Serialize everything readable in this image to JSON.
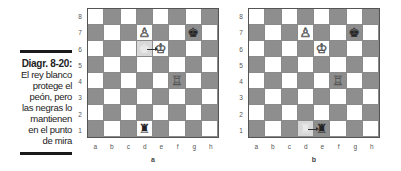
{
  "caption": {
    "title": "Diagr. 8-20:",
    "lines": [
      "El rey blanco",
      "protege el",
      "peón, pero",
      "las negras lo",
      "mantienen",
      "en el punto",
      "de mira"
    ]
  },
  "ranks": [
    "8",
    "7",
    "6",
    "5",
    "4",
    "3",
    "2",
    "1"
  ],
  "files": [
    "a",
    "b",
    "c",
    "d",
    "e",
    "f",
    "g",
    "h"
  ],
  "icons": {
    "white_king": "♔",
    "white_rook": "♖",
    "white_pawn": "♙",
    "black_king": "♚",
    "black_rook": "♜"
  },
  "boards": [
    {
      "id": "a",
      "pieces": [
        {
          "square": "d7",
          "piece": "white-pawn",
          "glyph": "♙",
          "color": "white"
        },
        {
          "square": "g7",
          "piece": "black-king",
          "glyph": "♚",
          "color": "black"
        },
        {
          "square": "d6",
          "piece": "white-king-ghost",
          "glyph": "♚",
          "color": "ghost"
        },
        {
          "square": "e6",
          "piece": "white-king",
          "glyph": "♔",
          "color": "white"
        },
        {
          "square": "f4",
          "piece": "white-rook",
          "glyph": "♖",
          "color": "white"
        },
        {
          "square": "d1",
          "piece": "black-rook",
          "glyph": "♜",
          "color": "black"
        }
      ],
      "moves": [
        {
          "from": "d6",
          "to": "e6"
        }
      ]
    },
    {
      "id": "b",
      "pieces": [
        {
          "square": "d7",
          "piece": "white-pawn",
          "glyph": "♙",
          "color": "white"
        },
        {
          "square": "g7",
          "piece": "black-king",
          "glyph": "♚",
          "color": "black"
        },
        {
          "square": "e6",
          "piece": "white-king",
          "glyph": "♔",
          "color": "white"
        },
        {
          "square": "f4",
          "piece": "white-rook",
          "glyph": "♖",
          "color": "white"
        },
        {
          "square": "d1",
          "piece": "black-rook-ghost",
          "glyph": "♜",
          "color": "ghost"
        },
        {
          "square": "e1",
          "piece": "black-rook",
          "glyph": "♜",
          "color": "black"
        }
      ],
      "moves": [
        {
          "from": "d1",
          "to": "e1"
        }
      ]
    }
  ]
}
